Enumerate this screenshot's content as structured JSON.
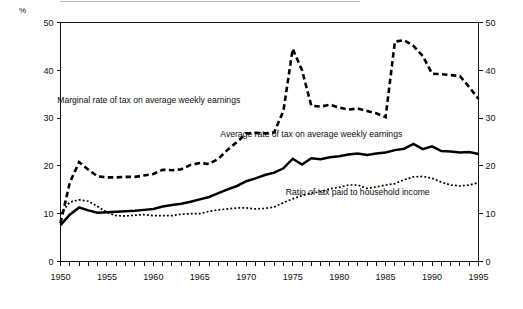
{
  "figure": {
    "unit_label": "%",
    "background": "#ffffff",
    "ink_color": "#000000"
  },
  "chart_data": {
    "type": "line",
    "title": "",
    "subtitle": "",
    "xlabel": "",
    "ylabel": "%",
    "xlim": [
      1950,
      1995
    ],
    "ylim": [
      0,
      50
    ],
    "grid": false,
    "legend_position": "inline-annotations",
    "y_ticks": [
      0,
      10,
      20,
      30,
      40,
      50
    ],
    "y_tick_labels_left": [
      "0",
      "10",
      "20",
      "30",
      "40",
      "50"
    ],
    "y_tick_labels_right": [
      "0",
      "10",
      "20",
      "30",
      "40",
      "50"
    ],
    "x_ticks": [
      1950,
      1951,
      1952,
      1953,
      1954,
      1955,
      1956,
      1957,
      1958,
      1959,
      1960,
      1961,
      1962,
      1963,
      1964,
      1965,
      1966,
      1967,
      1968,
      1969,
      1970,
      1971,
      1972,
      1973,
      1974,
      1975,
      1976,
      1977,
      1978,
      1979,
      1980,
      1981,
      1982,
      1983,
      1984,
      1985,
      1986,
      1987,
      1988,
      1989,
      1990,
      1991,
      1992,
      1993,
      1994,
      1995
    ],
    "x_tick_labels": [
      "1950",
      "1955",
      "1960",
      "1965",
      "1970",
      "1975",
      "1980",
      "1985",
      "1990",
      "1995"
    ],
    "x_labelled_ticks": [
      1950,
      1955,
      1960,
      1965,
      1970,
      1975,
      1980,
      1985,
      1990,
      1995
    ],
    "x": [
      1950,
      1951,
      1952,
      1953,
      1954,
      1955,
      1956,
      1957,
      1958,
      1959,
      1960,
      1961,
      1962,
      1963,
      1964,
      1965,
      1966,
      1967,
      1968,
      1969,
      1970,
      1971,
      1972,
      1973,
      1974,
      1975,
      1976,
      1977,
      1978,
      1979,
      1980,
      1981,
      1982,
      1983,
      1984,
      1985,
      1986,
      1987,
      1988,
      1989,
      1990,
      1991,
      1992,
      1993,
      1994,
      1995
    ],
    "series": [
      {
        "name": "Marginal rate of tax on average weekly earnings",
        "style": "dashed-thick",
        "label_x": 1959.5,
        "label_y": 33.2,
        "values": [
          8.0,
          16.5,
          20.8,
          19.2,
          17.8,
          17.6,
          17.6,
          17.7,
          17.7,
          18.0,
          18.3,
          19.2,
          19.1,
          19.3,
          20.2,
          20.6,
          20.4,
          21.5,
          23.4,
          25.0,
          26.8,
          26.9,
          26.8,
          27.0,
          31.5,
          44.5,
          40.0,
          32.6,
          32.4,
          32.8,
          32.2,
          31.8,
          32.0,
          31.5,
          31.0,
          30.2,
          46.0,
          46.3,
          45.1,
          43.0,
          39.3,
          39.2,
          39.0,
          38.8,
          36.5,
          34.0
        ]
      },
      {
        "name": "Average rate of tax on average weekly earnings",
        "style": "solid-thick",
        "label_x": 1977.0,
        "label_y": 26.0,
        "values": [
          7.6,
          9.8,
          11.3,
          10.7,
          10.2,
          10.3,
          10.4,
          10.5,
          10.6,
          10.8,
          11.0,
          11.5,
          11.8,
          12.1,
          12.5,
          13.0,
          13.5,
          14.3,
          15.1,
          15.8,
          16.8,
          17.4,
          18.1,
          18.6,
          19.5,
          21.5,
          20.3,
          21.6,
          21.4,
          21.8,
          22.0,
          22.4,
          22.6,
          22.3,
          22.6,
          22.8,
          23.3,
          23.6,
          24.6,
          23.5,
          24.1,
          23.1,
          23.0,
          22.8,
          22.9,
          22.5
        ]
      },
      {
        "name": "Ratio of tax paid to household income",
        "style": "dotted-thin",
        "label_x": 1982.0,
        "label_y": 14.0,
        "values": [
          10.0,
          12.4,
          12.9,
          12.6,
          11.5,
          10.3,
          9.6,
          9.5,
          9.7,
          9.8,
          9.6,
          9.6,
          9.6,
          9.9,
          10.0,
          10.0,
          10.5,
          10.8,
          11.0,
          11.2,
          11.2,
          11.0,
          11.1,
          11.4,
          12.3,
          13.1,
          13.8,
          14.3,
          14.6,
          15.2,
          15.5,
          16.0,
          16.0,
          15.3,
          15.6,
          16.0,
          16.3,
          17.1,
          17.7,
          17.8,
          17.4,
          16.6,
          16.0,
          15.8,
          16.0,
          16.5
        ]
      }
    ]
  }
}
